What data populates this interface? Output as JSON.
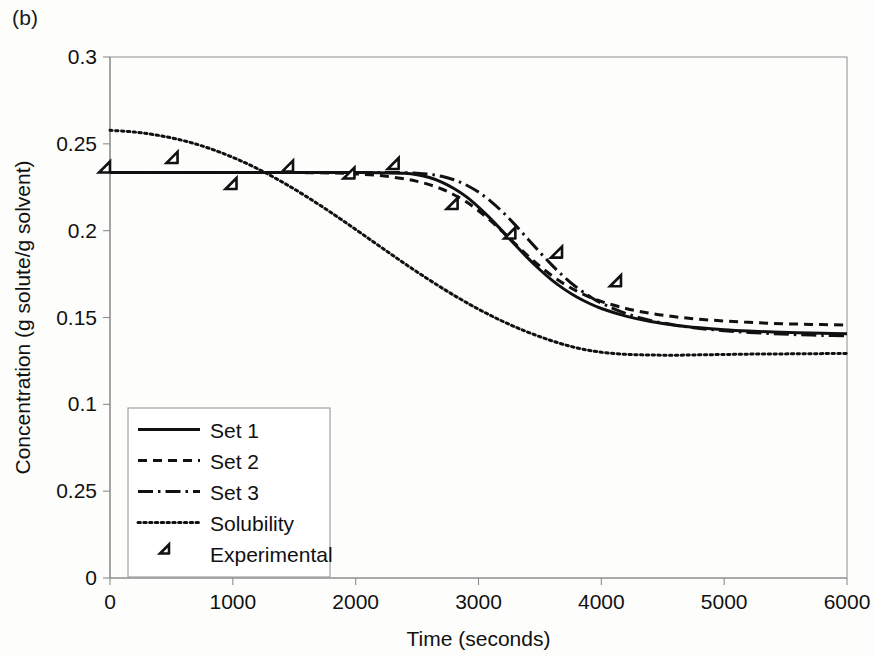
{
  "figure": {
    "panel_label": "(b)"
  },
  "chart_data": {
    "type": "line",
    "title": "",
    "xlabel": "Time (seconds)",
    "ylabel": "Concentration (g solute/g solvent)",
    "xlim": [
      0,
      6000
    ],
    "ylim": [
      0,
      0.3
    ],
    "xticks": [
      0,
      1000,
      2000,
      3000,
      4000,
      5000,
      6000
    ],
    "xticklabels": [
      "0",
      "1000",
      "2000",
      "3000",
      "4000",
      "5000",
      "6000"
    ],
    "yticks": [
      0,
      0.05,
      0.1,
      0.15,
      0.2,
      0.25,
      0.3
    ],
    "yticklabels": [
      "0",
      "0.25",
      "0.1",
      "0.15",
      "0.2",
      "0.25",
      "0.3"
    ],
    "grid": false,
    "legend_position": "lower-left",
    "series": [
      {
        "name": "Set 1",
        "style": "solid",
        "x": [
          0,
          200,
          400,
          600,
          800,
          1000,
          1200,
          1400,
          1600,
          1800,
          2000,
          2200,
          2400,
          2500,
          2600,
          2700,
          2800,
          2900,
          3000,
          3100,
          3200,
          3300,
          3400,
          3500,
          3600,
          3700,
          3800,
          3900,
          4000,
          4200,
          4400,
          4600,
          4800,
          5000,
          5200,
          5400,
          5600,
          5800,
          6000
        ],
        "y": [
          0.2335,
          0.2335,
          0.2335,
          0.2335,
          0.2335,
          0.2335,
          0.2335,
          0.2335,
          0.2335,
          0.2335,
          0.2335,
          0.2334,
          0.233,
          0.2322,
          0.2306,
          0.228,
          0.2243,
          0.2196,
          0.2136,
          0.2068,
          0.1993,
          0.1917,
          0.1843,
          0.1775,
          0.1714,
          0.1662,
          0.1618,
          0.1582,
          0.1552,
          0.1508,
          0.1477,
          0.1456,
          0.1441,
          0.143,
          0.1422,
          0.1416,
          0.1412,
          0.1409,
          0.1406
        ]
      },
      {
        "name": "Set 2",
        "style": "dashed",
        "x": [
          0,
          200,
          400,
          600,
          800,
          1000,
          1200,
          1400,
          1600,
          1800,
          2000,
          2200,
          2400,
          2500,
          2600,
          2700,
          2800,
          2900,
          3000,
          3100,
          3200,
          3300,
          3400,
          3500,
          3600,
          3700,
          3800,
          3900,
          4000,
          4200,
          4400,
          4600,
          4800,
          5000,
          5200,
          5400,
          5600,
          5800,
          6000
        ],
        "y": [
          0.2335,
          0.2335,
          0.2335,
          0.2335,
          0.2335,
          0.2335,
          0.2335,
          0.2335,
          0.2334,
          0.2332,
          0.2327,
          0.2317,
          0.2298,
          0.2284,
          0.2265,
          0.224,
          0.2207,
          0.2166,
          0.2115,
          0.2056,
          0.1991,
          0.1923,
          0.1857,
          0.1795,
          0.174,
          0.1692,
          0.1652,
          0.1619,
          0.1592,
          0.1552,
          0.1524,
          0.1504,
          0.149,
          0.148,
          0.1472,
          0.1466,
          0.1462,
          0.1459,
          0.1457
        ]
      },
      {
        "name": "Set 3",
        "style": "dash-dot",
        "x": [
          0,
          200,
          400,
          600,
          800,
          1000,
          1200,
          1400,
          1600,
          1800,
          2000,
          2200,
          2400,
          2500,
          2600,
          2700,
          2800,
          2900,
          3000,
          3100,
          3200,
          3300,
          3400,
          3500,
          3600,
          3700,
          3800,
          3900,
          4000,
          4200,
          4400,
          4600,
          4800,
          5000,
          5200,
          5400,
          5600,
          5800,
          6000
        ],
        "y": [
          0.2335,
          0.2335,
          0.2335,
          0.2335,
          0.2335,
          0.2335,
          0.2335,
          0.2335,
          0.2335,
          0.2335,
          0.2335,
          0.2335,
          0.2334,
          0.2331,
          0.2325,
          0.2313,
          0.2293,
          0.2263,
          0.2222,
          0.2169,
          0.2105,
          0.2032,
          0.1954,
          0.1875,
          0.18,
          0.1732,
          0.1673,
          0.1624,
          0.1583,
          0.1523,
          0.1483,
          0.1456,
          0.1437,
          0.1424,
          0.1414,
          0.1407,
          0.1401,
          0.1397,
          0.1394
        ]
      },
      {
        "name": "Solubility",
        "style": "dotted",
        "x": [
          0,
          200,
          400,
          600,
          800,
          1000,
          1200,
          1400,
          1600,
          1800,
          2000,
          2200,
          2400,
          2600,
          2800,
          3000,
          3200,
          3400,
          3600,
          3800,
          4000,
          4200,
          4400,
          4600,
          4800,
          5000,
          5200,
          5400,
          5600,
          5800,
          6000
        ],
        "y": [
          0.2578,
          0.2568,
          0.2548,
          0.2518,
          0.2476,
          0.2422,
          0.2357,
          0.2281,
          0.2196,
          0.2104,
          0.2007,
          0.1908,
          0.181,
          0.1716,
          0.1628,
          0.1548,
          0.1477,
          0.1416,
          0.1365,
          0.1325,
          0.13,
          0.1288,
          0.1284,
          0.1283,
          0.1285,
          0.1287,
          0.1289,
          0.129,
          0.1291,
          0.1292,
          0.1293
        ]
      },
      {
        "name": "Experimental",
        "style": "marker-diamond",
        "x": [
          0,
          550,
          1030,
          1490,
          1990,
          2350,
          2830,
          3300,
          3680,
          4160
        ],
        "y": [
          0.2335,
          0.239,
          0.224,
          0.234,
          0.23,
          0.2355,
          0.2125,
          0.1955,
          0.1845,
          0.168
        ]
      }
    ],
    "legend_entries": [
      {
        "label": "Set 1",
        "style": "solid"
      },
      {
        "label": "Set 2",
        "style": "dashed"
      },
      {
        "label": "Set 3",
        "style": "dash-dot"
      },
      {
        "label": "Solubility",
        "style": "dotted"
      },
      {
        "label": "Experimental",
        "style": "marker-diamond"
      }
    ]
  }
}
